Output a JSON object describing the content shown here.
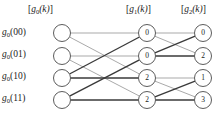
{
  "figure": {
    "type": "fft-butterfly-signal-flow-graph",
    "width": 221,
    "height": 119,
    "background_color": "#ffffff",
    "node_fill_color": "#ffffff",
    "node_stroke_color": "#4a4a4a",
    "edge_color_light": "#9a9a9a",
    "edge_color_dark": "#3a3a3a",
    "text_color": "#1a1a1a"
  },
  "columns": [
    {
      "id": "stage0",
      "header": "[g0(k)]",
      "header_base": "g",
      "header_sub": "0",
      "header_arg": "(k)"
    },
    {
      "id": "stage1",
      "header": "[g1(k)]",
      "header_base": "g",
      "header_sub": "1",
      "header_arg": "(k)"
    },
    {
      "id": "stage2",
      "header": "[g2(k)]",
      "header_base": "g",
      "header_sub": "2",
      "header_arg": "(k)"
    }
  ],
  "row_labels": [
    {
      "base": "g",
      "sub": "0",
      "arg": "(00)",
      "full": "g0(00)"
    },
    {
      "base": "g",
      "sub": "0",
      "arg": "(01)",
      "full": "g0(01)"
    },
    {
      "base": "g",
      "sub": "0",
      "arg": "(10)",
      "full": "g0(10)"
    },
    {
      "base": "g",
      "sub": "0",
      "arg": "(11)",
      "full": "g0(11)"
    }
  ],
  "nodes": {
    "column0_values": [
      "",
      "",
      "",
      ""
    ],
    "column1_values": [
      "0",
      "0",
      "2",
      "2"
    ],
    "column2_values": [
      "0",
      "2",
      "1",
      "3"
    ]
  },
  "edges": {
    "stage1": [
      {
        "from_row": 0,
        "to_row": 0,
        "weight": "light"
      },
      {
        "from_row": 0,
        "to_row": 2,
        "weight": "light"
      },
      {
        "from_row": 1,
        "to_row": 1,
        "weight": "light"
      },
      {
        "from_row": 1,
        "to_row": 3,
        "weight": "light"
      },
      {
        "from_row": 2,
        "to_row": 2,
        "weight": "dark"
      },
      {
        "from_row": 2,
        "to_row": 0,
        "weight": "dark"
      },
      {
        "from_row": 3,
        "to_row": 3,
        "weight": "dark"
      },
      {
        "from_row": 3,
        "to_row": 1,
        "weight": "dark"
      }
    ],
    "stage2": [
      {
        "from_row": 0,
        "to_row": 0,
        "weight": "light"
      },
      {
        "from_row": 0,
        "to_row": 1,
        "weight": "light"
      },
      {
        "from_row": 1,
        "to_row": 1,
        "weight": "dark"
      },
      {
        "from_row": 1,
        "to_row": 0,
        "weight": "dark"
      },
      {
        "from_row": 2,
        "to_row": 2,
        "weight": "light"
      },
      {
        "from_row": 2,
        "to_row": 3,
        "weight": "light"
      },
      {
        "from_row": 3,
        "to_row": 3,
        "weight": "dark"
      },
      {
        "from_row": 3,
        "to_row": 2,
        "weight": "dark"
      }
    ]
  },
  "geometry": {
    "column_x": [
      62,
      147,
      203
    ],
    "row_y": [
      33,
      56,
      78,
      100
    ],
    "node_radius": 8.5
  }
}
